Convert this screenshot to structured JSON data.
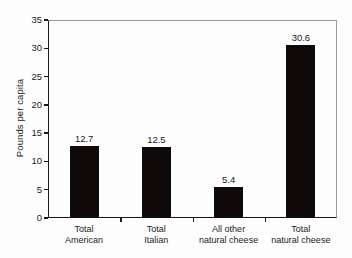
{
  "chart_data": {
    "type": "bar",
    "title": "",
    "xlabel": "",
    "ylabel": "Pounds per capita",
    "categories": [
      "Total American",
      "Total Italian",
      "All other natural cheese",
      "Total natural cheese"
    ],
    "category_lines": [
      [
        "Total",
        "American"
      ],
      [
        "Total",
        "Italian"
      ],
      [
        "All other",
        "natural cheese"
      ],
      [
        "Total",
        "natural cheese"
      ]
    ],
    "values": [
      12.7,
      12.5,
      5.4,
      30.6
    ],
    "value_labels": [
      "12.7",
      "12.5",
      "5.4",
      "30.6"
    ],
    "ylim": [
      0,
      35
    ],
    "yticks": [
      0,
      5,
      10,
      15,
      20,
      25,
      30,
      35
    ],
    "ytick_labels": [
      "0",
      "5",
      "10",
      "15",
      "20",
      "25",
      "30",
      "35"
    ],
    "grid": false,
    "legend": false,
    "bar_color": "#100909",
    "background_color": "#fdfdfd",
    "axis_color": "#1a1a1a"
  }
}
